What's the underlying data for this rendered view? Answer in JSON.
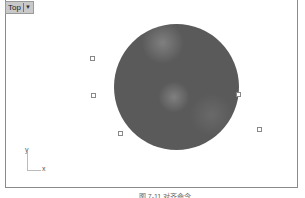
{
  "viewport": {
    "name": "Top",
    "dropdown_icon": "caret-down-icon"
  },
  "scene": {
    "object": "shaded-sphere",
    "control_points": [
      {
        "x": 91,
        "y": 57
      },
      {
        "x": 92,
        "y": 94
      },
      {
        "x": 119,
        "y": 132
      },
      {
        "x": 238,
        "y": 93
      },
      {
        "x": 258,
        "y": 128
      }
    ]
  },
  "axis_widget": {
    "y_label": "y",
    "x_label": "x"
  },
  "caption": {
    "text": "图 7-11 对齐命令"
  }
}
